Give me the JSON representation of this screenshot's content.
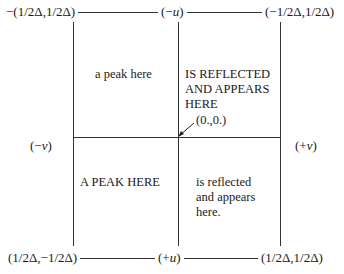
{
  "corners": {
    "top_left": "−(1/2Δ,1/2Δ)",
    "top_right": "(−1/2Δ,1/2Δ)",
    "bottom_left": "(1/2Δ,−1/2Δ)",
    "bottom_right": "(1/2Δ,1/2Δ)"
  },
  "axes": {
    "top": {
      "open": "(−",
      "var": "u",
      "close": ")"
    },
    "bottom": {
      "open": "(+",
      "var": "u",
      "close": ")"
    },
    "left": {
      "open": "(−",
      "var": "v",
      "close": ")"
    },
    "right": {
      "open": "(+",
      "var": "v",
      "close": ")"
    }
  },
  "origin_label": "(0.,0.)",
  "quadrants": {
    "upper_left": [
      "a peak here"
    ],
    "upper_right": [
      "IS REFLECTED",
      "AND APPEARS",
      "HERE"
    ],
    "lower_left": [
      "A PEAK HERE"
    ],
    "lower_right": [
      "is reflected",
      "and appears",
      "here."
    ]
  }
}
